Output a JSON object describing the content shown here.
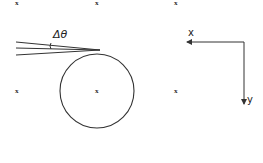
{
  "diagram": {
    "angle_label": "Δθ",
    "markers": [
      {
        "label": "x",
        "pos": [
          17,
          4
        ]
      },
      {
        "label": "x",
        "pos": [
          97,
          4
        ]
      },
      {
        "label": "x",
        "pos": [
          176,
          4
        ]
      },
      {
        "label": "x",
        "pos": [
          17,
          92
        ]
      },
      {
        "label": "x",
        "pos": [
          97,
          92
        ]
      },
      {
        "label": "x",
        "pos": [
          176,
          92
        ]
      }
    ],
    "circle": {
      "cx": 97,
      "cy": 91,
      "r": 37
    },
    "rays": [
      {
        "from": [
          16,
          42
        ],
        "to": [
          100,
          50
        ]
      },
      {
        "from": [
          16,
          48
        ],
        "to": [
          100,
          50
        ]
      },
      {
        "from": [
          16,
          55
        ],
        "to": [
          100,
          50
        ]
      }
    ],
    "axes": {
      "x_label": "x",
      "y_label": "y",
      "origin": [
        244,
        42
      ]
    },
    "stroke_color": "#333333"
  }
}
